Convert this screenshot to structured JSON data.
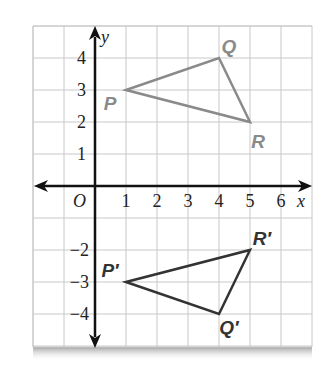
{
  "figure": {
    "grid": {
      "x_min": -2,
      "x_max": 7,
      "y_min": -5,
      "y_max": 5,
      "color": "#c8c8c8"
    },
    "axes": {
      "x_label": "x",
      "y_label": "y",
      "origin_label": "O",
      "x_ticks": [
        "1",
        "2",
        "3",
        "4",
        "5",
        "6"
      ],
      "y_ticks_positive": [
        "1",
        "2",
        "3",
        "4"
      ],
      "y_ticks_negative": [
        "−2",
        "−3",
        "−4"
      ],
      "color": "#111111"
    },
    "triangles": [
      {
        "name": "PQR",
        "color": "#8a8a8a",
        "vertices": [
          {
            "label": "P",
            "x": 1,
            "y": 3,
            "lx": 110,
            "ly": 110
          },
          {
            "label": "Q",
            "x": 4,
            "y": 4,
            "lx": 229,
            "ly": 53
          },
          {
            "label": "R",
            "x": 5,
            "y": 2,
            "lx": 258,
            "ly": 148
          }
        ]
      },
      {
        "name": "P'Q'R'",
        "color": "#333333",
        "vertices": [
          {
            "label": "P′",
            "x": 1,
            "y": -3,
            "lx": 110,
            "ly": 277
          },
          {
            "label": "Q′",
            "x": 4,
            "y": -4,
            "lx": 229,
            "ly": 334
          },
          {
            "label": "R′",
            "x": 5,
            "y": -2,
            "lx": 262,
            "ly": 245
          }
        ]
      }
    ]
  }
}
